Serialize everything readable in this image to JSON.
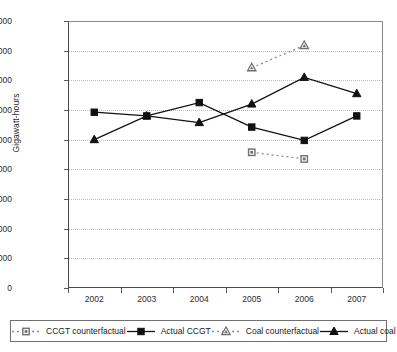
{
  "chart_data": {
    "type": "line",
    "title": "",
    "xlabel": "",
    "ylabel": "Gigawatt-hours",
    "categories": [
      "2002",
      "2003",
      "2004",
      "2005",
      "2006",
      "2007"
    ],
    "ylim": [
      0,
      180000
    ],
    "ytick_values": [
      0,
      20000,
      40000,
      60000,
      80000,
      100000,
      120000,
      140000,
      160000,
      180000
    ],
    "ytick_labels": [
      "0",
      "20,000",
      "40,000",
      "60,000",
      "80,000",
      "100,000",
      "120,000",
      "140,000",
      "160,000",
      "180,000"
    ],
    "grid": true,
    "legend_position": "bottom",
    "series": [
      {
        "name": "CCGT counterfactual",
        "marker": "square-open",
        "line": "dotted",
        "color": "#8c8c8c",
        "x": [
          "2005",
          "2006"
        ],
        "values": [
          91500,
          87000
        ]
      },
      {
        "name": "Actual CCGT",
        "marker": "square-filled",
        "line": "solid",
        "color": "#111111",
        "x": [
          "2002",
          "2003",
          "2004",
          "2005",
          "2006",
          "2007"
        ],
        "values": [
          118500,
          116000,
          125000,
          108500,
          99500,
          116000
        ]
      },
      {
        "name": "Coal counterfactual",
        "marker": "triangle-open",
        "line": "dotted",
        "color": "#8c8c8c",
        "x": [
          "2005",
          "2006"
        ],
        "values": [
          148500,
          163500
        ]
      },
      {
        "name": "Actual coal",
        "marker": "triangle-filled",
        "line": "solid",
        "color": "#111111",
        "x": [
          "2002",
          "2003",
          "2004",
          "2005",
          "2006",
          "2007"
        ],
        "values": [
          100000,
          116000,
          111500,
          124000,
          142000,
          131000
        ]
      }
    ]
  },
  "axis": {
    "ylabel": "Gigawatt-hours"
  },
  "legend": {
    "items": [
      {
        "label": "CCGT counterfactual"
      },
      {
        "label": "Actual CCGT"
      },
      {
        "label": "Coal counterfactual"
      },
      {
        "label": "Actual coal"
      }
    ]
  }
}
